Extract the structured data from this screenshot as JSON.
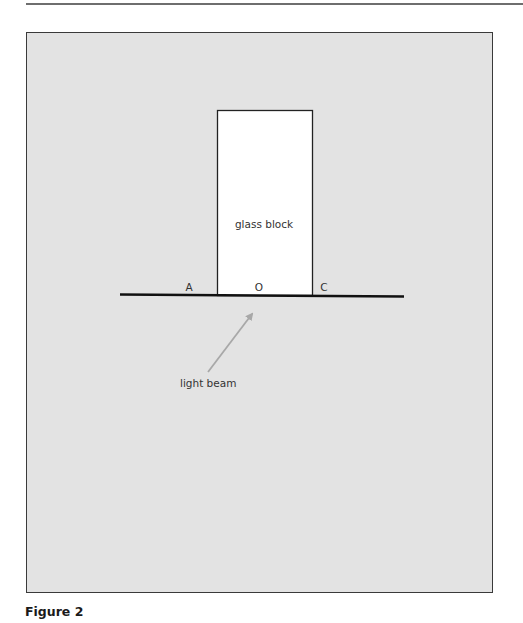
{
  "figure": {
    "caption": "Figure 2",
    "block_label": "glass block",
    "points": {
      "A": "A",
      "O": "O",
      "C": "C"
    },
    "beam_label": "light beam",
    "colors": {
      "panel_bg": "#e3e3e3",
      "block_fill": "#ffffff",
      "line": "#111111",
      "arrow": "#a8a8a8"
    }
  }
}
